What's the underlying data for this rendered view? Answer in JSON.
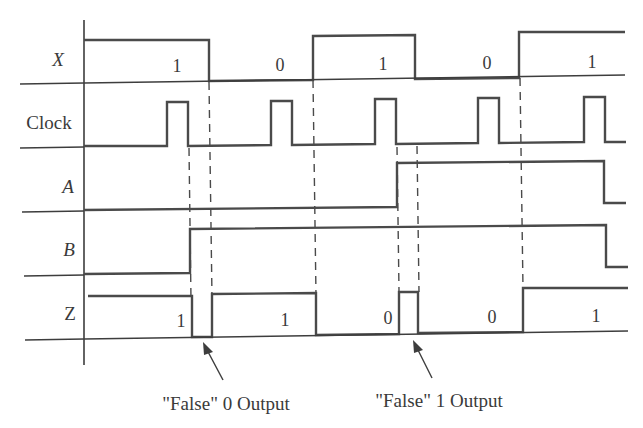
{
  "diagram": {
    "type": "timing-diagram",
    "signals": [
      {
        "name": "X",
        "italic": true,
        "values": [
          "1",
          "0",
          "1",
          "0",
          "1"
        ]
      },
      {
        "name": "Clock",
        "italic": false,
        "pulses": 5
      },
      {
        "name": "A",
        "italic": true
      },
      {
        "name": "B",
        "italic": true
      },
      {
        "name": "Z",
        "italic": false,
        "values": [
          "1",
          "1",
          "0",
          "0",
          "1"
        ]
      }
    ],
    "annotations": [
      {
        "id": "false-0",
        "text": "\"False\" 0 Output"
      },
      {
        "id": "false-1",
        "text": "\"False\" 1 Output"
      }
    ],
    "colors": {
      "line": "#4a4a4a",
      "text": "#3a3a3a",
      "background": "#ffffff"
    }
  }
}
